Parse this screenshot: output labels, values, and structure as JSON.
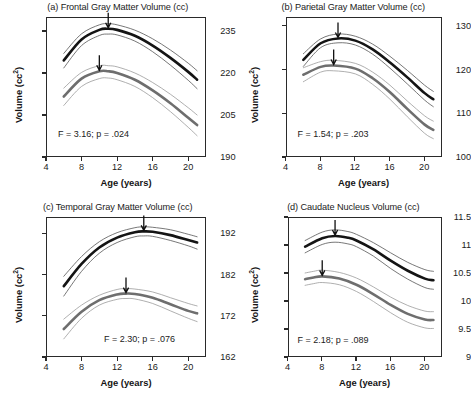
{
  "figure": {
    "width": 471,
    "height": 400,
    "background": "#ffffff",
    "series_colors": {
      "male": "#141414",
      "female": "#6e6e6e",
      "confidence_band": "#9a9a9a",
      "axis": "#2a2a2a"
    }
  },
  "chart_data": [
    {
      "type": "line",
      "panel": "a",
      "title": "(a) Frontal Gray Matter Volume (cc)",
      "xlabel": "Age (years)",
      "ylabel": "Volume (cc²)",
      "xlim": [
        4,
        22
      ],
      "ylim": [
        190,
        240
      ],
      "xticks": [
        4,
        8,
        12,
        16,
        20
      ],
      "xticklabels": [
        "4",
        "8",
        "12",
        "16",
        "20"
      ],
      "yticks": [
        190,
        205,
        220,
        235
      ],
      "yticklabels": [
        "190",
        "205",
        "220",
        "235"
      ],
      "grid": false,
      "legend": "none",
      "annotation": "F = 3.16; p = .024",
      "stat_F": "3.16",
      "stat_p": ".024",
      "series": [
        {
          "name": "male",
          "color": "#141414",
          "x": [
            6,
            8,
            10,
            11,
            12,
            14,
            16,
            18,
            20,
            21
          ],
          "values": [
            224.5,
            232.0,
            235.4,
            235.8,
            235.4,
            233.3,
            229.8,
            225.4,
            220.4,
            217.6
          ],
          "peak_age": 11.0,
          "peak_value": 235.8,
          "upper_band": [
            227.0,
            234.0,
            237.2,
            237.6,
            237.2,
            235.3,
            232.2,
            228.2,
            223.5,
            220.8
          ],
          "lower_band": [
            221.8,
            229.8,
            233.4,
            233.9,
            233.6,
            231.4,
            227.6,
            222.8,
            217.4,
            214.4
          ]
        },
        {
          "name": "female",
          "color": "#6e6e6e",
          "x": [
            6,
            8,
            10,
            11,
            12,
            14,
            16,
            18,
            20,
            21
          ],
          "values": [
            211.6,
            218.0,
            220.6,
            220.6,
            220.0,
            217.6,
            213.8,
            209.2,
            204.0,
            201.4
          ],
          "peak_age": 10.0,
          "peak_value": 220.6,
          "upper_band": [
            214.6,
            220.2,
            222.6,
            222.6,
            222.2,
            220.0,
            216.6,
            212.4,
            207.6,
            205.0
          ],
          "lower_band": [
            208.4,
            215.2,
            218.0,
            218.2,
            217.6,
            215.2,
            211.2,
            206.2,
            200.6,
            197.6
          ]
        }
      ]
    },
    {
      "type": "line",
      "panel": "b",
      "title": "(b) Parietal Gray Matter Volume (cc)",
      "xlabel": "Age (years)",
      "ylabel": "Volume (cc²)",
      "xlim": [
        4,
        22
      ],
      "ylim": [
        100,
        132
      ],
      "xticks": [
        4,
        8,
        12,
        16,
        20
      ],
      "xticklabels": [
        "4",
        "8",
        "12",
        "16",
        "20"
      ],
      "yticks": [
        100,
        110,
        120,
        130
      ],
      "yticklabels": [
        "100",
        "110",
        "120",
        "130"
      ],
      "grid": false,
      "legend": "none",
      "annotation": "F = 1.54; p = .203",
      "stat_F": "1.54",
      "stat_p": ".203",
      "series": [
        {
          "name": "male",
          "color": "#141414",
          "x": [
            6,
            8,
            10,
            12,
            14,
            16,
            18,
            20,
            21
          ],
          "values": [
            122.2,
            126.0,
            127.1,
            126.6,
            124.6,
            121.6,
            118.2,
            114.6,
            113.2
          ],
          "peak_age": 10.0,
          "peak_value": 127.1,
          "upper_band": [
            123.6,
            127.0,
            128.1,
            127.6,
            125.8,
            123.0,
            119.8,
            116.4,
            115.0
          ],
          "lower_band": [
            120.7,
            125.0,
            126.1,
            125.6,
            123.5,
            120.3,
            116.7,
            113.0,
            111.5
          ]
        },
        {
          "name": "female",
          "color": "#6e6e6e",
          "x": [
            6,
            8,
            9.5,
            12,
            14,
            16,
            18,
            20,
            21
          ],
          "values": [
            118.8,
            120.6,
            120.9,
            120.2,
            118.0,
            114.8,
            111.0,
            107.4,
            106.2
          ],
          "peak_age": 9.5,
          "peak_value": 120.9,
          "upper_band": [
            120.4,
            121.8,
            122.1,
            121.4,
            119.4,
            116.4,
            112.8,
            109.4,
            108.2
          ],
          "lower_band": [
            117.2,
            119.4,
            119.7,
            119.0,
            116.6,
            113.2,
            109.2,
            105.4,
            104.2
          ]
        }
      ]
    },
    {
      "type": "line",
      "panel": "c",
      "title": "(c) Temporal Gray Matter Volume (cc)",
      "xlabel": "Age (years)",
      "ylabel": "Volume (cc²)",
      "xlim": [
        4,
        22
      ],
      "ylim": [
        162,
        196
      ],
      "xticks": [
        4,
        8,
        12,
        16,
        20
      ],
      "xticklabels": [
        "4",
        "8",
        "12",
        "16",
        "20"
      ],
      "yticks": [
        162,
        172,
        182,
        192
      ],
      "yticklabels": [
        "162",
        "172",
        "182",
        "192"
      ],
      "grid": false,
      "legend": "none",
      "annotation": "F = 2.30; p = .076",
      "stat_F": "2.30",
      "stat_p": ".076",
      "series": [
        {
          "name": "male",
          "color": "#141414",
          "x": [
            6,
            8,
            10,
            12,
            14,
            15,
            16,
            18,
            20,
            21
          ],
          "values": [
            179.2,
            184.6,
            188.6,
            191.0,
            192.3,
            192.5,
            192.4,
            191.6,
            190.4,
            189.8
          ],
          "peak_age": 15.0,
          "peak_value": 192.5,
          "upper_band": [
            181.6,
            186.4,
            190.0,
            192.2,
            193.4,
            193.6,
            193.5,
            192.9,
            191.8,
            191.2
          ],
          "lower_band": [
            176.8,
            182.8,
            187.2,
            189.8,
            191.2,
            191.4,
            191.3,
            190.3,
            189.0,
            188.2
          ]
        },
        {
          "name": "female",
          "color": "#6e6e6e",
          "x": [
            6,
            8,
            10,
            12,
            13,
            14,
            16,
            18,
            20,
            21
          ],
          "values": [
            168.8,
            173.0,
            175.8,
            177.2,
            177.4,
            177.3,
            176.4,
            174.8,
            173.2,
            172.6
          ],
          "peak_age": 13.0,
          "peak_value": 177.4,
          "upper_band": [
            171.2,
            174.6,
            177.0,
            178.4,
            178.6,
            178.5,
            177.8,
            176.4,
            175.0,
            174.4
          ],
          "lower_band": [
            166.4,
            171.4,
            174.6,
            176.0,
            176.2,
            176.1,
            175.0,
            173.2,
            171.4,
            170.6
          ]
        }
      ]
    },
    {
      "type": "line",
      "panel": "d",
      "title": "(d) Caudate Nucleus Volume (cc)",
      "xlabel": "Age (years)",
      "ylabel": "Volume (cc²)",
      "xlim": [
        4,
        22
      ],
      "ylim": [
        9,
        11.5
      ],
      "xticks": [
        4,
        8,
        12,
        16,
        20
      ],
      "xticklabels": [
        "4",
        "8",
        "12",
        "16",
        "20"
      ],
      "yticks": [
        9,
        9.5,
        10,
        10.5,
        11,
        11.5
      ],
      "yticklabels": [
        "9",
        "9.5",
        "10",
        "10.5",
        "11",
        "11.5"
      ],
      "grid": false,
      "legend": "none",
      "annotation": "F = 2.18;  p = .089",
      "stat_F": "2.18",
      "stat_p": ".089",
      "series": [
        {
          "name": "male",
          "color": "#141414",
          "x": [
            6,
            8,
            9.5,
            11,
            12,
            14,
            16,
            18,
            20,
            21
          ],
          "values": [
            10.97,
            11.12,
            11.16,
            11.13,
            11.08,
            10.92,
            10.72,
            10.54,
            10.4,
            10.37
          ],
          "peak_age": 9.5,
          "peak_value": 11.16,
          "upper_band": [
            11.08,
            11.23,
            11.27,
            11.24,
            11.19,
            11.04,
            10.86,
            10.69,
            10.56,
            10.53
          ],
          "lower_band": [
            10.86,
            11.01,
            11.05,
            11.02,
            10.97,
            10.8,
            10.58,
            10.39,
            10.24,
            10.21
          ]
        },
        {
          "name": "female",
          "color": "#6e6e6e",
          "x": [
            6,
            7,
            8,
            10,
            12,
            14,
            16,
            18,
            20,
            21
          ],
          "values": [
            10.39,
            10.42,
            10.44,
            10.4,
            10.29,
            10.12,
            9.93,
            9.77,
            9.67,
            9.66
          ],
          "peak_age": 8.0,
          "peak_value": 10.44,
          "upper_band": [
            10.5,
            10.53,
            10.55,
            10.51,
            10.41,
            10.25,
            10.07,
            9.92,
            9.82,
            9.81
          ],
          "lower_band": [
            10.28,
            10.31,
            10.33,
            10.29,
            10.17,
            9.99,
            9.79,
            9.62,
            9.52,
            9.51
          ]
        }
      ]
    }
  ]
}
